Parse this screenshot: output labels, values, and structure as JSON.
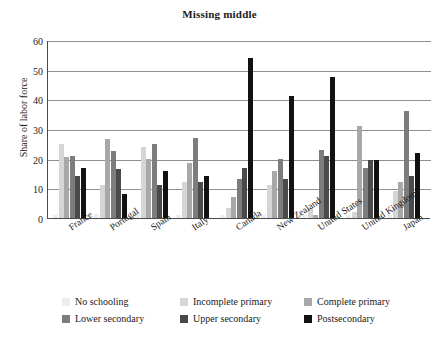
{
  "chart_data": {
    "type": "bar",
    "title": "Missing middle",
    "xlabel": "",
    "ylabel": "Share of labor force",
    "ylim": [
      0,
      60
    ],
    "yticks": [
      0,
      10,
      20,
      30,
      40,
      50,
      60
    ],
    "grid": true,
    "legend_position": "bottom",
    "categories": [
      "France",
      "Portugal",
      "Spain",
      "Italy",
      "Canada",
      "New Zealand",
      "United States",
      "United Kingdom",
      "Japan"
    ],
    "series": [
      {
        "name": "No schooling",
        "color": "#ececec",
        "values": [
          1.0,
          1.5,
          2.0,
          1.0,
          1.0,
          1.0,
          1.0,
          1.0,
          1.0
        ]
      },
      {
        "name": "Incomplete primary",
        "color": "#d5d5d5",
        "values": [
          25.0,
          11.0,
          24.0,
          12.0,
          3.5,
          11.0,
          3.5,
          2.0,
          9.0
        ]
      },
      {
        "name": "Complete primary",
        "color": "#a8a8a8",
        "values": [
          20.5,
          26.5,
          20.0,
          18.5,
          7.0,
          16.0,
          1.0,
          31.0,
          12.0
        ]
      },
      {
        "name": "Lower secondary",
        "color": "#7d7d7d",
        "values": [
          21.0,
          22.5,
          25.0,
          27.0,
          13.0,
          20.0,
          23.0,
          17.0,
          36.0
        ]
      },
      {
        "name": "Upper secondary",
        "color": "#4a4a4a",
        "values": [
          14.0,
          16.5,
          11.0,
          12.0,
          17.0,
          13.0,
          21.0,
          19.5,
          14.0
        ]
      },
      {
        "name": "Postsecondary",
        "color": "#111111",
        "values": [
          17.0,
          8.0,
          16.0,
          14.0,
          54.0,
          41.0,
          47.5,
          19.5,
          22.0
        ]
      }
    ]
  }
}
